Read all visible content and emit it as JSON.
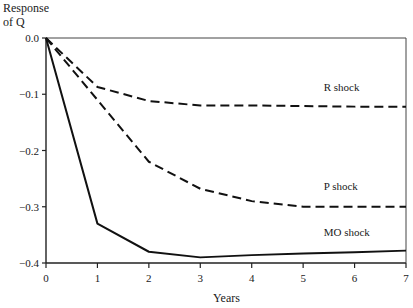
{
  "chart_data": {
    "type": "line",
    "title": "",
    "xlabel": "Years",
    "ylabel": "Response of Q",
    "ylabel_lines": [
      "Response",
      "of Q"
    ],
    "x": [
      0,
      1,
      2,
      3,
      4,
      5,
      6,
      7
    ],
    "xlim": [
      0,
      7
    ],
    "ylim": [
      -0.4,
      0.0
    ],
    "xticks": [
      "0",
      "1",
      "2",
      "3",
      "4",
      "5",
      "6",
      "7"
    ],
    "yticks": [
      {
        "value": 0.0,
        "label": "0.0"
      },
      {
        "value": -0.1,
        "label": "−0.1"
      },
      {
        "value": -0.2,
        "label": "−0.2"
      },
      {
        "value": -0.3,
        "label": "−0.3"
      },
      {
        "value": -0.4,
        "label": "−0.4"
      }
    ],
    "grid": false,
    "legend": "inline labels",
    "series": [
      {
        "name": "R shock",
        "style": "dashed",
        "label_x": 5.4,
        "label_y": -0.095,
        "values": [
          0.0,
          -0.087,
          -0.112,
          -0.12,
          -0.12,
          -0.121,
          -0.122,
          -0.122
        ]
      },
      {
        "name": "P shock",
        "style": "dashed",
        "label_x": 5.4,
        "label_y": -0.27,
        "values": [
          0.0,
          -0.11,
          -0.22,
          -0.268,
          -0.29,
          -0.3,
          -0.3,
          -0.3
        ]
      },
      {
        "name": "MO shock",
        "style": "solid",
        "label_x": 5.4,
        "label_y": -0.352,
        "values": [
          0.0,
          -0.33,
          -0.38,
          -0.39,
          -0.386,
          -0.383,
          -0.381,
          -0.378
        ]
      }
    ]
  },
  "labels": {
    "ylabel_line1": "Response",
    "ylabel_line2": "of Q",
    "xlabel": "Years"
  }
}
